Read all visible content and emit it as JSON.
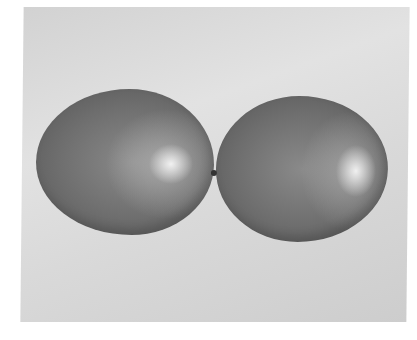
{
  "image": {
    "description": "Grayscale photograph of two balloons touching at their knotted ends against a light gray background",
    "subjects": [
      "left-balloon",
      "right-balloon"
    ],
    "colors": {
      "background": "#dcdcdc",
      "balloon": "#6e6e6e",
      "highlight": "#f0f0f0",
      "page": "#ffffff"
    }
  }
}
